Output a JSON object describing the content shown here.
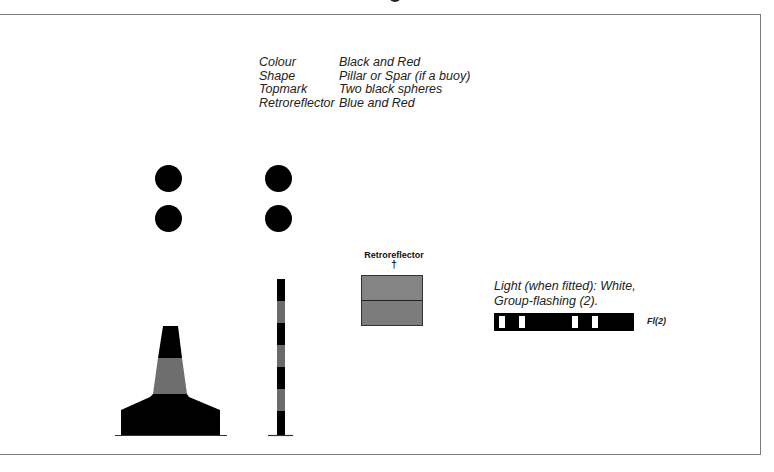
{
  "diagram": {
    "title_fragment_visible": true,
    "properties": [
      {
        "key": "Colour",
        "value": "Black and Red"
      },
      {
        "key": "Shape",
        "value": "Pillar or Spar (if a buoy)"
      },
      {
        "key": "Topmark",
        "value": "Two black spheres"
      },
      {
        "key": "Retroreflector",
        "value": "Blue and Red"
      }
    ],
    "figures": {
      "pillar_buoy": {
        "topmark": "two black spheres",
        "bands": [
          "black",
          "red",
          "black"
        ]
      },
      "spar_buoy": {
        "topmark": "two black spheres",
        "bands": [
          "black",
          "red",
          "black",
          "red",
          "black",
          "red",
          "black"
        ]
      },
      "retroreflector": {
        "label": "Retroreflector",
        "marker": "†",
        "bands": [
          "blue",
          "red"
        ]
      }
    },
    "light": {
      "line1": "Light (when fitted): White,",
      "line2": "Group-flashing (2).",
      "abbrev": "Fl(2)",
      "pattern": "two groups of two flashes"
    },
    "colors": {
      "black": "#000000",
      "red_band": "#6e6e6e",
      "retro_fill": "#808080",
      "frame": "#7a7a7a"
    }
  }
}
